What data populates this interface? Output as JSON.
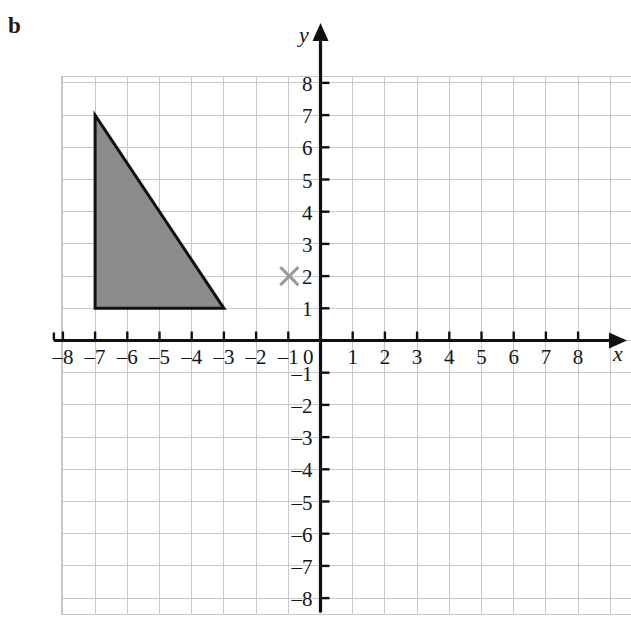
{
  "figure": {
    "part_label": "b",
    "axis_labels": {
      "x": "x",
      "y": "y"
    }
  },
  "chart_data": {
    "type": "scatter",
    "title": "",
    "xlabel": "x",
    "ylabel": "y",
    "xlim": [
      -8,
      8
    ],
    "ylim": [
      -8,
      8
    ],
    "grid": true,
    "legend": "none",
    "xticks": [
      -8,
      -7,
      -6,
      -5,
      -4,
      -3,
      -2,
      -1,
      0,
      1,
      2,
      3,
      4,
      5,
      6,
      7,
      8
    ],
    "yticks": [
      -8,
      -7,
      -6,
      -5,
      -4,
      -3,
      -2,
      -1,
      0,
      1,
      2,
      3,
      4,
      5,
      6,
      7,
      8
    ],
    "xtick_labels": [
      "–8",
      "–7",
      "–6",
      "–5",
      "–4",
      "–3",
      "–2",
      "–1",
      "0",
      "1",
      "2",
      "3",
      "4",
      "5",
      "6",
      "7",
      "8"
    ],
    "ytick_labels": [
      "–8",
      "–7",
      "–6",
      "–5",
      "–4",
      "–3",
      "–2",
      "–1",
      "0",
      "1",
      "2",
      "3",
      "4",
      "5",
      "6",
      "7",
      "8"
    ],
    "shapes": [
      {
        "name": "shaded-triangle",
        "type": "polygon",
        "vertices": [
          [
            -7,
            7
          ],
          [
            -7,
            1
          ],
          [
            -3,
            1
          ]
        ],
        "fill": "#8b8b8b",
        "stroke": "#111111"
      }
    ],
    "markers": [
      {
        "name": "centre-of-rotation",
        "glyph": "cross",
        "x": -1,
        "y": 2,
        "color": "#9a9a9a"
      }
    ],
    "colors": {
      "grid": "#c8c8cc",
      "axis": "#101010",
      "shape_fill": "#8b8b8b",
      "shape_stroke": "#111111",
      "marker": "#9a9a9a"
    }
  }
}
